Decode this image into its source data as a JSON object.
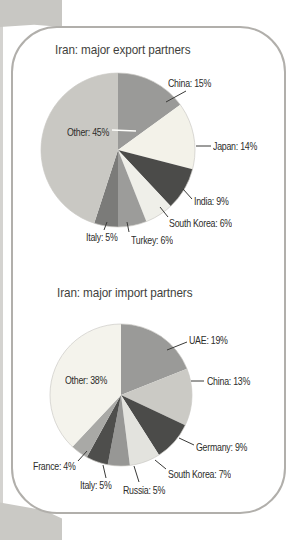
{
  "page": {
    "background_color": "#ffffff",
    "panel_border_color": "#b1afab",
    "left_strip_color": "#d4d3d0",
    "corner_texture_color": "#c8c7c3",
    "text_color": "#2d2d2b",
    "leader_line_color": "#3a3a38"
  },
  "chart_data": [
    {
      "type": "pie",
      "title": "Iran: major export partners",
      "unit": "%",
      "categories": [
        "China",
        "Japan",
        "India",
        "South Korea",
        "Turkey",
        "Italy",
        "Other"
      ],
      "values": [
        15,
        14,
        9,
        6,
        6,
        5,
        45
      ],
      "start_angle_deg": 0,
      "direction": "clockwise",
      "legend_position": "labels-around-with-leader-lines",
      "other_label_leader_color": "#ffffff",
      "slices": [
        {
          "name": "China",
          "value": 15,
          "label": "China: 15%",
          "color": "#9a9a98"
        },
        {
          "name": "Japan",
          "value": 14,
          "label": "Japan: 14%",
          "color": "#f3f2e9"
        },
        {
          "name": "India",
          "value": 9,
          "label": "India: 9%",
          "color": "#4b4b49"
        },
        {
          "name": "South Korea",
          "value": 6,
          "label": "South Korea: 6%",
          "color": "#efefe9"
        },
        {
          "name": "Turkey",
          "value": 6,
          "label": "Turkey: 6%",
          "color": "#9c9c9a"
        },
        {
          "name": "Italy",
          "value": 5,
          "label": "Italy: 5%",
          "color": "#7b7b79"
        },
        {
          "name": "Other",
          "value": 45,
          "label": "Other: 45%",
          "color": "#c9c8c3"
        }
      ]
    },
    {
      "type": "pie",
      "title": "Iran: major import partners",
      "unit": "%",
      "categories": [
        "UAE",
        "China",
        "Germany",
        "South Korea",
        "Russia",
        "Italy",
        "France",
        "Other"
      ],
      "values": [
        19,
        13,
        9,
        7,
        5,
        5,
        4,
        38
      ],
      "start_angle_deg": 0,
      "direction": "clockwise",
      "legend_position": "labels-around-with-leader-lines",
      "slices": [
        {
          "name": "UAE",
          "value": 19,
          "label": "UAE: 19%",
          "color": "#9a9a98"
        },
        {
          "name": "China",
          "value": 13,
          "label": "China: 13%",
          "color": "#cbcac5"
        },
        {
          "name": "Germany",
          "value": 9,
          "label": "Germany: 9%",
          "color": "#4b4b49"
        },
        {
          "name": "South Korea",
          "value": 7,
          "label": "South Korea: 7%",
          "color": "#e3e3de"
        },
        {
          "name": "Russia",
          "value": 5,
          "label": "Russia: 5%",
          "color": "#979795"
        },
        {
          "name": "Italy",
          "value": 5,
          "label": "Italy: 5%",
          "color": "#4e4e4c"
        },
        {
          "name": "France",
          "value": 4,
          "label": "France: 4%",
          "color": "#a9a9a6"
        },
        {
          "name": "Other",
          "value": 38,
          "label": "Other: 38%",
          "color": "#f4f3ec"
        }
      ]
    }
  ]
}
